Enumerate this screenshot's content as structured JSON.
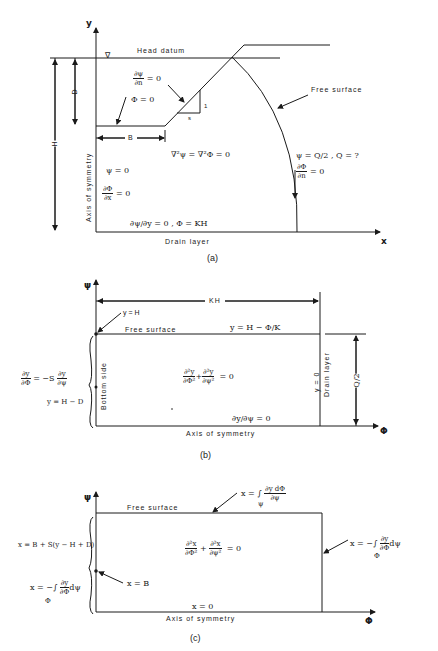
{
  "panel_a": {
    "caption": "(a)",
    "axis_y": "y",
    "axis_x": "x",
    "head_datum_label": "Head datum",
    "water_symbol": "∇",
    "dim_D": "D",
    "dim_H": "H",
    "dim_B": "B",
    "slope_rise": "1",
    "slope_run": "s",
    "slope_bc_top": "∂ψ/∂n = 0",
    "slope_bc_num": "∂ψ",
    "slope_bc_den": "∂n",
    "slope_bc_rhs": "= 0",
    "slope_phi": "Φ = 0",
    "laplace": "∇²ψ = ∇²Φ = 0",
    "axis_symmetry_label": "Axis of symmetry",
    "axis_psi": "ψ = 0",
    "axis_dphi_num": "∂Φ",
    "axis_dphi_den": "∂x",
    "axis_dphi_rhs": "= 0",
    "free_surface_label": "Free surface",
    "free_psi": "ψ = Q/2 ,  Q = ?",
    "free_dphi_num": "∂Φ",
    "free_dphi_den": "∂n",
    "free_dphi_rhs": "= 0",
    "bottom_bc": "∂ψ/∂y = 0 ,   Φ = KH",
    "drain_layer_label": "Drain layer"
  },
  "panel_b": {
    "caption": "(b)",
    "axis_y": "ψ",
    "axis_x": "Φ",
    "dim_KH": "KH",
    "y_eq_H": "y = H",
    "free_surface_label": "Free surface",
    "free_surface_eq": "y = H − Φ/K",
    "left_bc_num1": "∂y",
    "left_bc_den1": "∂Φ",
    "left_bc_mid": "= −S",
    "left_bc_num2": "∂y",
    "left_bc_den2": "∂ψ",
    "left_bc2": "y = H − D",
    "bottom_side_label": "Bottom side",
    "laplace_num1": "∂²y",
    "laplace_den1": "∂Φ²",
    "laplace_num2": "∂²y",
    "laplace_den2": "∂ψ²",
    "laplace_rhs": "= 0",
    "right_y0": "y = 0",
    "drain_layer_label": "Drain layer",
    "dim_Q2": "Q/2",
    "bottom_bc": "∂y/∂ψ = 0",
    "axis_symmetry_label": "Axis of symmetry"
  },
  "panel_c": {
    "caption": "(c)",
    "axis_y": "ψ",
    "axis_x": "Φ",
    "free_surface_label": "Free surface",
    "top_eq_lhs": "x = ∫",
    "top_eq_sub": "ψ",
    "top_eq_num": "∂y dΦ",
    "top_eq_den": "∂ψ",
    "right_eq_lhs": "x = −∫",
    "right_eq_sub": "Φ",
    "right_eq_num": "∂y",
    "right_eq_den": "∂Φ",
    "right_eq_tail": "dψ",
    "left_eq1": "x = B + S(y − H + D)",
    "left_eq2_lhs": "x = −∫",
    "left_eq2_sub": "Φ",
    "left_eq2_num": "∂y",
    "left_eq2_den": "∂Φ",
    "left_eq2_tail": "dψ",
    "x_eq_B": "x = B",
    "laplace_num1": "∂²x",
    "laplace_den1": "∂Φ²",
    "laplace_num2": "∂²x",
    "laplace_den2": "∂ψ²",
    "laplace_rhs": "= 0",
    "bottom_bc": "x = 0",
    "axis_symmetry_label": "Axis of symmetry"
  }
}
